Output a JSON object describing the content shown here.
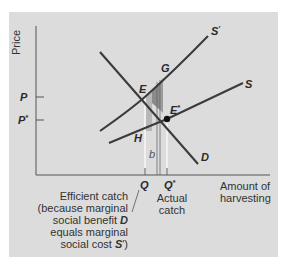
{
  "figure": {
    "y_axis_label": "Price",
    "x_axis_label_line1": "Amount of",
    "x_axis_label_line2": "harvesting",
    "price_ticks": [
      {
        "label": "P",
        "sup": ""
      },
      {
        "label": "P",
        "sup": "*"
      }
    ],
    "quantity_ticks": [
      {
        "label": "Q",
        "sup": ""
      },
      {
        "label": "Q",
        "sup": "*"
      }
    ],
    "curves": {
      "demand": {
        "label": "D"
      },
      "private_supply": {
        "label": "S"
      },
      "social_supply": {
        "label": "S",
        "sup": "′"
      }
    },
    "points": {
      "E": "E",
      "E_star": {
        "label": "E",
        "sup": "*"
      },
      "G": "G",
      "H": "H",
      "b": "b"
    },
    "annotations": {
      "efficient_catch": {
        "line1": "Efficient catch",
        "line2": "(because marginal",
        "line3_pre": "social benefit ",
        "line3_bold": "D",
        "line4": "equals marginal",
        "line5_pre": "social cost ",
        "line5_bold": "S",
        "line5_post": "′)"
      },
      "actual_catch": {
        "line1": "Actual",
        "line2": "catch"
      }
    },
    "colors": {
      "panel": "#dcdcdc",
      "curve": "#3a3a3a",
      "shade_dark": "#8c8c8c",
      "shade_light": "#b4b4b4",
      "guide_line": "#f4f4f4"
    }
  }
}
